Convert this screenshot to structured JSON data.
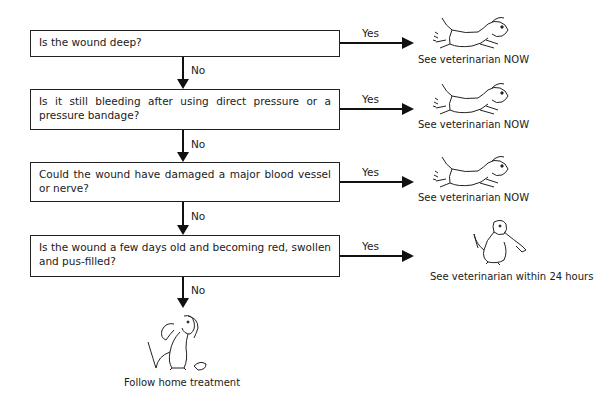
{
  "flowchart": {
    "title": "Wound assessment decision flowchart",
    "questions": [
      {
        "text": "Is the wound deep?",
        "yes_label": "Yes",
        "no_label": "No",
        "outcome": "See veterinarian NOW",
        "outcome_icon": "running-dog-icon"
      },
      {
        "text": "Is it still bleeding after using direct pressure or a pressure bandage?",
        "yes_label": "Yes",
        "no_label": "No",
        "outcome": "See veterinarian NOW",
        "outcome_icon": "running-dog-icon"
      },
      {
        "text": "Could the wound have damaged a major blood vessel or nerve?",
        "yes_label": "Yes",
        "no_label": "No",
        "outcome": "See veterinarian NOW",
        "outcome_icon": "running-dog-icon"
      },
      {
        "text": "Is the wound a few days old and becoming red, swollen and pus-filled?",
        "yes_label": "Yes",
        "no_label": "No",
        "outcome": "See veterinarian within 24 hours",
        "outcome_icon": "sitting-dog-phone-icon"
      }
    ],
    "final": {
      "text": "Follow home treatment",
      "icon": "sitting-dog-icon"
    }
  }
}
